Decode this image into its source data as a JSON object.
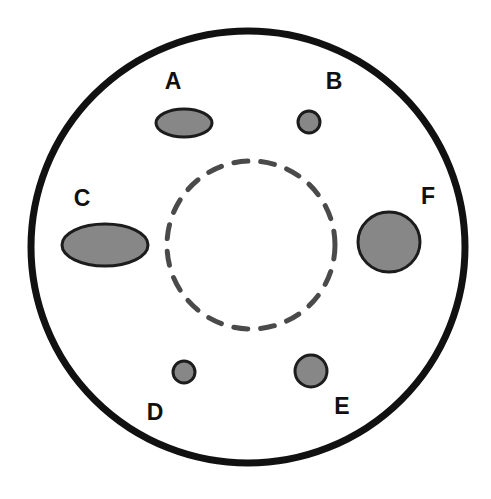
{
  "figure": {
    "type": "schematic-diagram",
    "title": "",
    "background_color": "#ffffff",
    "width": 491,
    "height": 499
  },
  "colors": {
    "outer_circle_stroke": "#111111",
    "dashed_circle_stroke": "#4a4a4a",
    "shape_fill": "#878787",
    "shape_stroke": "#1c1c1c",
    "label_color": "#101010"
  },
  "outer_boundary": {
    "name": "outer-circle",
    "shape": "circle",
    "cx": 248,
    "cy": 247,
    "rx": 217,
    "ry": 216,
    "stroke_width": 7,
    "fill": "none",
    "dashed": false
  },
  "inner_boundary": {
    "name": "inner-dashed-circle",
    "shape": "circle",
    "cx": 251,
    "cy": 245,
    "r": 84,
    "stroke_width": 5,
    "fill": "none",
    "dashed": true,
    "dash_pattern": "14 13"
  },
  "shapes": [
    {
      "id": "A",
      "label": "A",
      "shape": "ellipse",
      "cx": 184,
      "cy": 123,
      "rx": 28,
      "ry": 14,
      "label_x": 173,
      "label_y": 83,
      "size_rank": "medium-elongated"
    },
    {
      "id": "B",
      "label": "B",
      "shape": "ellipse",
      "cx": 309,
      "cy": 122,
      "rx": 11,
      "ry": 11,
      "label_x": 334,
      "label_y": 83,
      "size_rank": "small"
    },
    {
      "id": "C",
      "label": "C",
      "shape": "ellipse",
      "cx": 105,
      "cy": 245,
      "rx": 43,
      "ry": 21,
      "label_x": 82,
      "label_y": 200,
      "size_rank": "large-elongated"
    },
    {
      "id": "D",
      "label": "D",
      "shape": "ellipse",
      "cx": 184,
      "cy": 372,
      "rx": 11,
      "ry": 11,
      "label_x": 155,
      "label_y": 414,
      "size_rank": "smallest"
    },
    {
      "id": "E",
      "label": "E",
      "shape": "ellipse",
      "cx": 311,
      "cy": 371,
      "rx": 16,
      "ry": 16,
      "label_x": 342,
      "label_y": 408,
      "size_rank": "small-medium"
    },
    {
      "id": "F",
      "label": "F",
      "shape": "ellipse",
      "cx": 389,
      "cy": 242,
      "rx": 31,
      "ry": 30,
      "label_x": 428,
      "label_y": 198,
      "size_rank": "largest-round"
    }
  ]
}
